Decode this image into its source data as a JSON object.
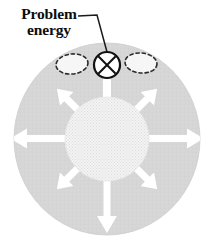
{
  "figure": {
    "label": {
      "line1": "Problem",
      "line2": "energy"
    },
    "colors": {
      "background": "#ffffff",
      "outer_disc": "#d6d6d6",
      "outer_disc_edge": "#cfcfcf",
      "core_circle": "#eeeeee",
      "core_hatch": "#e2e2e2",
      "arrow_fill": "#ffffff",
      "symbol_stroke": "#111111",
      "symbol_fill": "#ffffff",
      "blob_fill": "#f4f4f4",
      "blob_stroke": "#2b2b2b",
      "leader_stroke": "#1a1a1a",
      "text": "#0d0d0d"
    },
    "outer_disc": {
      "cx": 107,
      "cy": 139,
      "rx": 93,
      "ry": 96
    },
    "core_circle": {
      "cx": 107,
      "cy": 139,
      "r": 42
    },
    "problem_symbol": {
      "name": "crossed-circle",
      "cx": 107,
      "cy": 65,
      "r": 13
    },
    "blobs": [
      {
        "name": "blob-left",
        "cx": 72,
        "cy": 64,
        "rx": 16,
        "ry": 10,
        "rotate": -6
      },
      {
        "name": "blob-right",
        "cx": 141,
        "cy": 63,
        "rx": 16,
        "ry": 10,
        "rotate": 5
      }
    ],
    "leader_line": {
      "points": "78,16 97,15 107,52"
    },
    "arrows": [
      {
        "name": "arrow-up",
        "angle": -90,
        "head": false,
        "length": 30
      },
      {
        "name": "arrow-upper-right",
        "angle": -45,
        "head": true,
        "length": 48
      },
      {
        "name": "arrow-right",
        "angle": 0,
        "head": true,
        "length": 52
      },
      {
        "name": "arrow-lower-right",
        "angle": 45,
        "head": true,
        "length": 48
      },
      {
        "name": "arrow-down",
        "angle": 90,
        "head": true,
        "length": 52
      },
      {
        "name": "arrow-lower-left",
        "angle": 135,
        "head": true,
        "length": 48
      },
      {
        "name": "arrow-left",
        "angle": 180,
        "head": true,
        "length": 52
      },
      {
        "name": "arrow-upper-left",
        "angle": -135,
        "head": true,
        "length": 48
      }
    ]
  }
}
